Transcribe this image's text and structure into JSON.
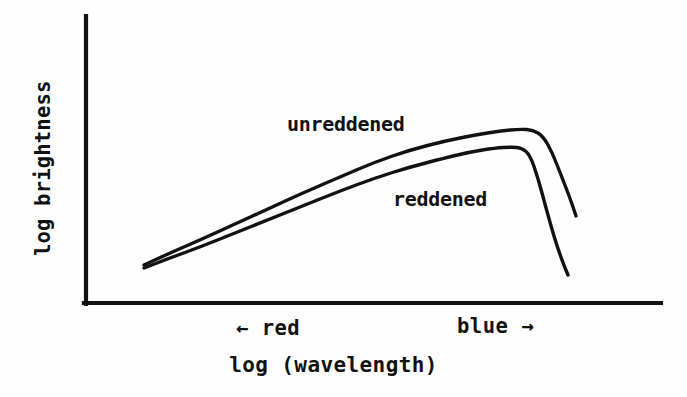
{
  "figure": {
    "background_color": "#fefefe",
    "ink_color": "#121212",
    "axes": {
      "y_label": "log brightness",
      "x_label": "log (wavelength)",
      "x_tick_left": "← red",
      "x_tick_right": "blue →",
      "origin_px": [
        85,
        303
      ],
      "x_axis_end_px": [
        661,
        303
      ],
      "y_axis_top_px": [
        85,
        16
      ]
    },
    "series_labels": {
      "unreddened": "unreddened",
      "reddened": "reddened"
    }
  },
  "chart_data": {
    "type": "line",
    "title": "",
    "subtitle": "",
    "xlabel": "log (wavelength)",
    "ylabel": "log brightness",
    "grid": false,
    "legend": "inline-annotations",
    "axis_ticks_numeric": false,
    "xlim": [
      0,
      1
    ],
    "ylim": [
      0,
      1
    ],
    "x_tick_labels": [
      "← red",
      "blue →"
    ],
    "x_tick_positions_px": [
      300,
      510
    ],
    "annotations": [
      {
        "text": "unreddened",
        "x_px": 287,
        "y_px": 114
      },
      {
        "text": "reddened",
        "x_px": 393,
        "y_px": 189
      }
    ],
    "series": [
      {
        "name": "unreddened",
        "comment": "upper curve: rises nearly linearly toward the blue, peaks then falls steeply",
        "points_px": [
          [
            144,
            265
          ],
          [
            170,
            253
          ],
          [
            200,
            240
          ],
          [
            235,
            224
          ],
          [
            270,
            208
          ],
          [
            305,
            192
          ],
          [
            340,
            177
          ],
          [
            375,
            162
          ],
          [
            410,
            150
          ],
          [
            445,
            141
          ],
          [
            475,
            135
          ],
          [
            500,
            131
          ],
          [
            520,
            129
          ],
          [
            533,
            130
          ],
          [
            543,
            136
          ],
          [
            552,
            152
          ],
          [
            561,
            175
          ],
          [
            570,
            198
          ],
          [
            576,
            216
          ]
        ]
      },
      {
        "name": "reddened",
        "comment": "lower curve: same slope but offset downward, peaks earlier and falls much more steeply",
        "points_px": [
          [
            144,
            268
          ],
          [
            170,
            258
          ],
          [
            200,
            247
          ],
          [
            235,
            233
          ],
          [
            270,
            219
          ],
          [
            305,
            205
          ],
          [
            340,
            191
          ],
          [
            375,
            178
          ],
          [
            410,
            167
          ],
          [
            445,
            158
          ],
          [
            470,
            152
          ],
          [
            495,
            148
          ],
          [
            512,
            147
          ],
          [
            522,
            148
          ],
          [
            530,
            155
          ],
          [
            538,
            178
          ],
          [
            546,
            208
          ],
          [
            555,
            240
          ],
          [
            563,
            263
          ],
          [
            568,
            275
          ]
        ]
      }
    ]
  }
}
